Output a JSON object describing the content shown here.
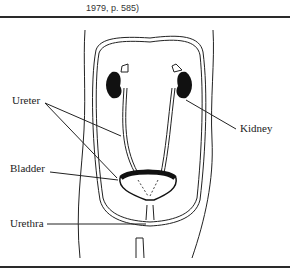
{
  "caption": "1979, p. 585)",
  "labels": {
    "ureter": "Ureter",
    "kidney": "Kidney",
    "bladder": "Bladder",
    "urethra": "Urethra"
  }
}
